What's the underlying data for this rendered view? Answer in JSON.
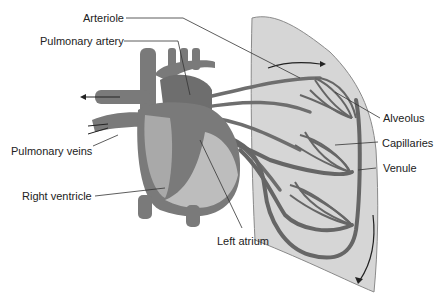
{
  "diagram": {
    "type": "anatomical-illustration",
    "colors": {
      "background": "#ffffff",
      "lung_fill": "#d6d6d6",
      "lung_stroke": "#8a8a8a",
      "vessel": "#6e6e6e",
      "vessel_dark": "#555555",
      "heart": "#7a7a7a",
      "heart_light": "#bdbdbd",
      "leader_line": "#333333",
      "label_text": "#222222"
    },
    "labels": {
      "arteriole": "Arteriole",
      "pulmonary_artery": "Pulmonary artery",
      "pulmonary_veins": "Pulmonary veins",
      "right_ventricle": "Right ventricle",
      "left_atrium": "Left atrium",
      "alveolus": "Alveolus",
      "capillaries": "Capillaries",
      "venule": "Venule"
    }
  }
}
